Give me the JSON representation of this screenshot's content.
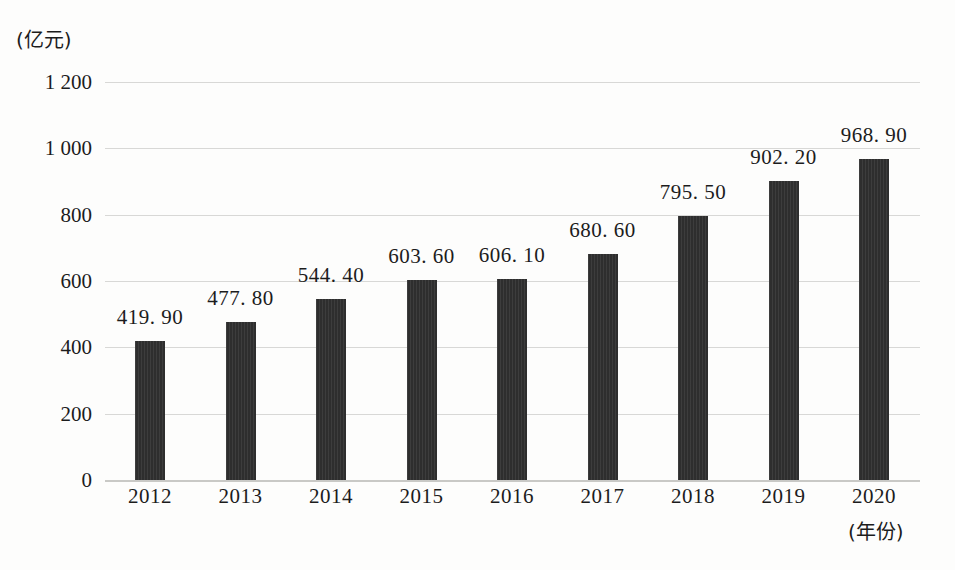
{
  "chart_data": {
    "type": "bar",
    "title": "",
    "subtitle": "",
    "xlabel": "(年份)",
    "ylabel": "(亿元)",
    "categories": [
      "2012",
      "2013",
      "2014",
      "2015",
      "2016",
      "2017",
      "2018",
      "2019",
      "2020"
    ],
    "values": [
      419.9,
      477.8,
      544.4,
      603.6,
      606.1,
      680.6,
      795.5,
      902.2,
      968.9
    ],
    "value_labels": [
      "419. 90",
      "477. 80",
      "544. 40",
      "603. 60",
      "606. 10",
      "680. 60",
      "795. 50",
      "902. 20",
      "968. 90"
    ],
    "ylim": [
      0,
      1200
    ],
    "ytick_values": [
      0,
      200,
      400,
      600,
      800,
      1000,
      1200
    ],
    "ytick_labels": [
      "0",
      "200",
      "400",
      "600",
      "800",
      "1 000",
      "1 200"
    ],
    "grid": true,
    "legend": false,
    "legend_position": "none",
    "bar_color": "#2e2e2e",
    "gridline_color": "#d8d8d6",
    "background_color": "#fdfdfc",
    "text_color": "#1c1c1c"
  }
}
